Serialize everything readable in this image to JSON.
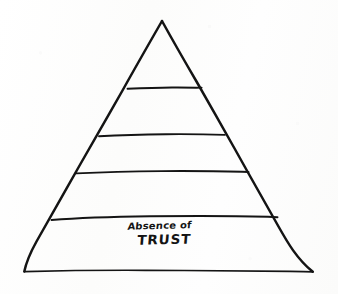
{
  "diagram": {
    "shape": "pyramid",
    "background_color": "#fdfdfd",
    "ink_color": "#141414",
    "style": "hand-drawn sketch",
    "band_count": 5,
    "apex": {
      "x": 162,
      "y": 21
    },
    "base_left": {
      "x": 24,
      "y": 272
    },
    "base_right": {
      "x": 313,
      "y": 272
    },
    "divider_y": [
      88,
      135,
      172,
      217
    ],
    "bands": [
      {
        "index": 1,
        "position": "top",
        "label": "",
        "empty": true
      },
      {
        "index": 2,
        "position": "upper-middle",
        "label": "",
        "empty": true
      },
      {
        "index": 3,
        "position": "middle",
        "label": "",
        "empty": true
      },
      {
        "index": 4,
        "position": "lower-middle",
        "label": "",
        "empty": true
      },
      {
        "index": 5,
        "position": "bottom",
        "label": "Absence of TRUST",
        "empty": false
      }
    ],
    "bottom_band": {
      "line1": "Absence of",
      "line2": "TRUST"
    }
  }
}
